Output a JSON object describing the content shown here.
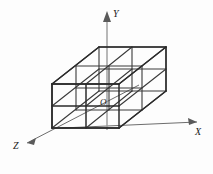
{
  "figure": {
    "kind": "3d-cube-lattice-diagram",
    "background_color": "#fdfdfd",
    "edge_color": "#2b2b2b",
    "axis_color": "#6d6d6d",
    "label_color": "#1a1a1a",
    "divisions_per_side": 2,
    "unit_cube_count": 8
  },
  "axes": {
    "origin": {
      "label": "O",
      "x": 107,
      "y": 103
    },
    "items": [
      {
        "name": "y-axis",
        "label": "Y",
        "direction": "up",
        "arrow": true
      },
      {
        "name": "x-axis",
        "label": "X",
        "direction": "right",
        "arrow": true
      },
      {
        "name": "z-axis",
        "label": "Z",
        "direction": "down-left",
        "arrow": true
      }
    ]
  },
  "labels": {
    "y": "Y",
    "x": "X",
    "z": "Z",
    "origin": "O"
  }
}
